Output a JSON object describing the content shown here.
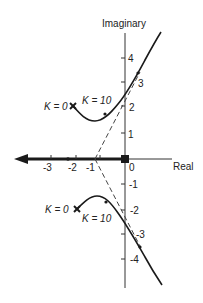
{
  "diagram": {
    "type": "root-locus",
    "axes": {
      "x_label": "Real",
      "y_label": "Imaginary",
      "x_ticks": [
        "-3",
        "-2",
        "-1",
        "0"
      ],
      "y_ticks_pos": [
        "1",
        "2",
        "3",
        "4"
      ],
      "y_ticks_neg": [
        "-1",
        "-2",
        "-3",
        "-4"
      ]
    },
    "annotations": {
      "upper_k0": "K = 0",
      "upper_k10": "K = 10",
      "lower_k0": "K = 0",
      "lower_k10": "K = 10"
    },
    "poles": [
      {
        "real": -2,
        "imag": 2,
        "marker": "x"
      },
      {
        "real": -2,
        "imag": -2,
        "marker": "x"
      },
      {
        "real": 0,
        "imag": 0,
        "marker": "square"
      }
    ],
    "asymptote_origin": {
      "real": -1,
      "imag": 0
    },
    "colors": {
      "line": "#1a1a1a",
      "dashed": "#444444"
    }
  }
}
